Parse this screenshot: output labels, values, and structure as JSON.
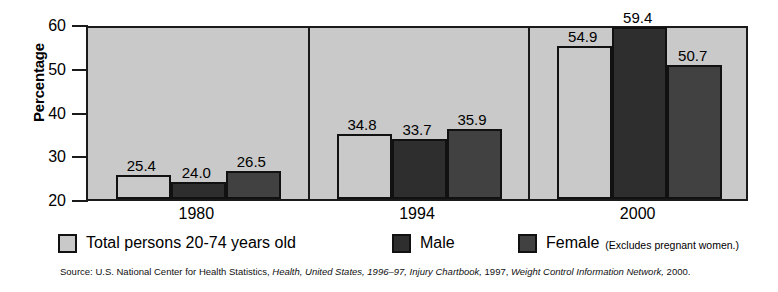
{
  "chart_data": {
    "type": "bar",
    "title": "",
    "subtitle": "",
    "xlabel": "",
    "ylabel": "Percentage",
    "categories": [
      "1980",
      "1994",
      "2000"
    ],
    "ylim": [
      20,
      60
    ],
    "yticks": [
      20,
      30,
      40,
      50,
      60
    ],
    "ytick_labels": [
      "20",
      "30",
      "40",
      "50",
      "60"
    ],
    "grid": false,
    "legend_position": "bottom",
    "series": [
      {
        "name": "Total persons 20-74 years old",
        "key": "total",
        "color": "#c9c9c9",
        "values": [
          25.4,
          24.0,
          54.9
        ],
        "value_labels": [
          "25.4",
          "24.0",
          "54.9"
        ]
      },
      {
        "name": "Male",
        "key": "male",
        "color": "#2e2e2e",
        "values": [
          24.0,
          33.7,
          59.4
        ],
        "value_labels": [
          "24.0",
          "33.7",
          "59.4"
        ]
      },
      {
        "name": "Female",
        "key": "female",
        "color": "#414141",
        "values": [
          26.5,
          35.9,
          50.7
        ],
        "value_labels": [
          "26.5",
          "35.9",
          "50.7"
        ]
      }
    ],
    "groups": [
      {
        "category": "1980",
        "bars": [
          {
            "series": "Total persons 20-74 years old",
            "key": "total",
            "value": 25.4,
            "label": "25.4"
          },
          {
            "series": "Male",
            "key": "male",
            "value": 24.0,
            "label": "24.0"
          },
          {
            "series": "Female",
            "key": "female",
            "value": 26.5,
            "label": "26.5"
          }
        ]
      },
      {
        "category": "1994",
        "bars": [
          {
            "series": "Total persons 20-74 years old",
            "key": "total",
            "value": 34.8,
            "label": "34.8"
          },
          {
            "series": "Male",
            "key": "male",
            "value": 33.7,
            "label": "33.7"
          },
          {
            "series": "Female",
            "key": "female",
            "value": 35.9,
            "label": "35.9"
          }
        ]
      },
      {
        "category": "2000",
        "bars": [
          {
            "series": "Total persons 20-74 years old",
            "key": "total",
            "value": 54.9,
            "label": "54.9"
          },
          {
            "series": "Male",
            "key": "male",
            "value": 59.4,
            "label": "59.4"
          },
          {
            "series": "Female",
            "key": "female",
            "value": 50.7,
            "label": "50.7"
          }
        ]
      }
    ],
    "annotations": [
      "(Excludes pregnant women.)"
    ]
  },
  "legend": {
    "items": [
      {
        "label": "Total persons 20-74 years old",
        "key": "total",
        "note": ""
      },
      {
        "label": "Male",
        "key": "male",
        "note": ""
      },
      {
        "label": "Female",
        "key": "female",
        "note": "(Excludes pregnant women.)"
      }
    ]
  },
  "source": {
    "prefix": "Source:",
    "text": "U.S. National Center for Health Statistics,",
    "italic_1": "Health, United States, 1996–97, Injury Chartbook,",
    "middle": "1997,",
    "italic_2": "Weight Control Information Network,",
    "suffix": "2000."
  },
  "colors": {
    "plot_background": "#c9c9c9",
    "axis": "#1a1a1a",
    "total_bar": "#c9c9c9",
    "male_bar": "#2e2e2e",
    "female_bar": "#414141",
    "page_background": "#ffffff"
  }
}
